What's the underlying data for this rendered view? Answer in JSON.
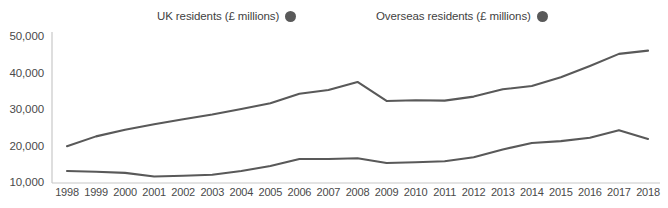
{
  "chart_data": {
    "type": "line",
    "title": "",
    "subtitle": "",
    "xlabel": "",
    "ylabel": "",
    "grid": false,
    "legend_position": "top",
    "xlim": [
      1998,
      2018
    ],
    "ylim": [
      10000,
      50000
    ],
    "y_ticks": [
      "50,000",
      "40,000",
      "30,000",
      "20,000",
      "10,000"
    ],
    "y_tick_values": [
      50000,
      40000,
      30000,
      20000,
      10000
    ],
    "categories": [
      "1998",
      "1999",
      "2000",
      "2001",
      "2002",
      "2003",
      "2004",
      "2005",
      "2006",
      "2007",
      "2008",
      "2009",
      "2010",
      "2011",
      "2012",
      "2013",
      "2014",
      "2015",
      "2016",
      "2017",
      "2018"
    ],
    "x": [
      1998,
      1999,
      2000,
      2001,
      2002,
      2003,
      2004,
      2005,
      2006,
      2007,
      2008,
      2009,
      2010,
      2011,
      2012,
      2013,
      2014,
      2015,
      2016,
      2017,
      2018
    ],
    "series": [
      {
        "name": "UK residents (£ millions)",
        "color": "#595959",
        "values": [
          19800,
          22500,
          24300,
          25800,
          27200,
          28500,
          30000,
          31600,
          34200,
          35200,
          37400,
          32200,
          32400,
          32300,
          33400,
          35400,
          36300,
          38700,
          41800,
          45100,
          46000
        ]
      },
      {
        "name": "Overseas residents (£ millions)",
        "color": "#595959",
        "values": [
          13000,
          12800,
          12500,
          11500,
          11700,
          12000,
          13000,
          14400,
          16300,
          16300,
          16500,
          15200,
          15400,
          15700,
          16800,
          18900,
          20700,
          21200,
          22100,
          24200,
          21800
        ]
      }
    ],
    "legend": [
      {
        "label": "UK residents (£ millions)",
        "marker": "circle",
        "color": "#595959"
      },
      {
        "label": "Overseas residents (£ millions)",
        "marker": "circle",
        "color": "#595959"
      }
    ]
  },
  "axis": {
    "line_color": "#c8c8c8"
  }
}
